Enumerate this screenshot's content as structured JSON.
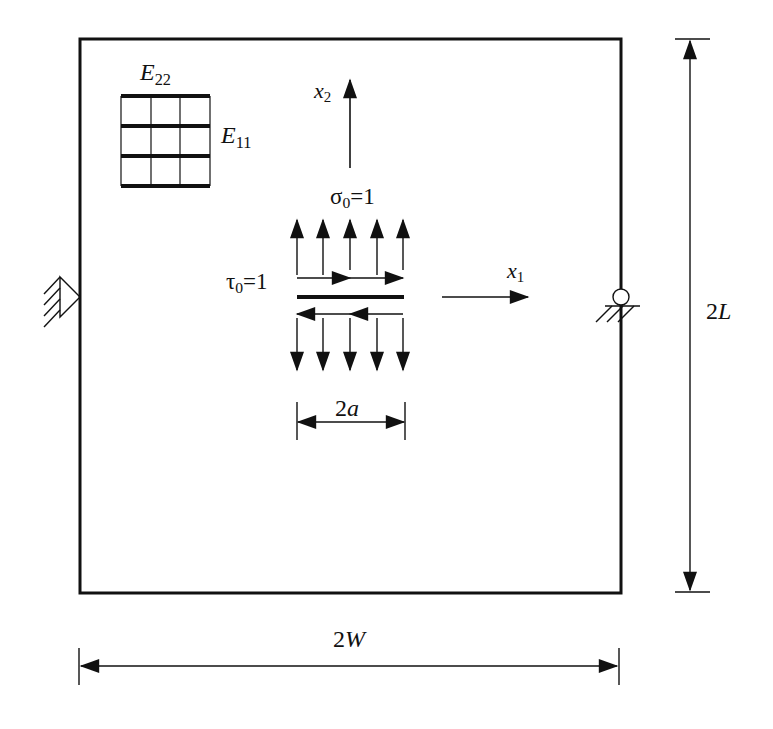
{
  "figure": {
    "colors": {
      "ink": "#111111",
      "background": "#ffffff"
    }
  },
  "plate": {
    "width_label": {
      "main": "2",
      "var": "W"
    },
    "height_label": {
      "main": "2",
      "var": "L"
    }
  },
  "material": {
    "e22_label": {
      "main": "E",
      "sub": "22"
    },
    "e11_label": {
      "main": "E",
      "sub": "11"
    }
  },
  "axes": {
    "x1_label": {
      "main": "x",
      "sub": "1"
    },
    "x2_label": {
      "main": "x",
      "sub": "2"
    }
  },
  "loads": {
    "sigma_label": {
      "main": "σ",
      "sub": "0",
      "rest": "=1"
    },
    "tau_label": {
      "main": "τ",
      "sub": "0",
      "rest": "=1"
    },
    "normal_arrow_count": 5,
    "shear_arrow_count_per_face": 2
  },
  "crack": {
    "length_label": {
      "main": "2",
      "var": "a"
    }
  },
  "supports": {
    "left": "pinned-support-icon",
    "right": "roller-support-icon"
  }
}
